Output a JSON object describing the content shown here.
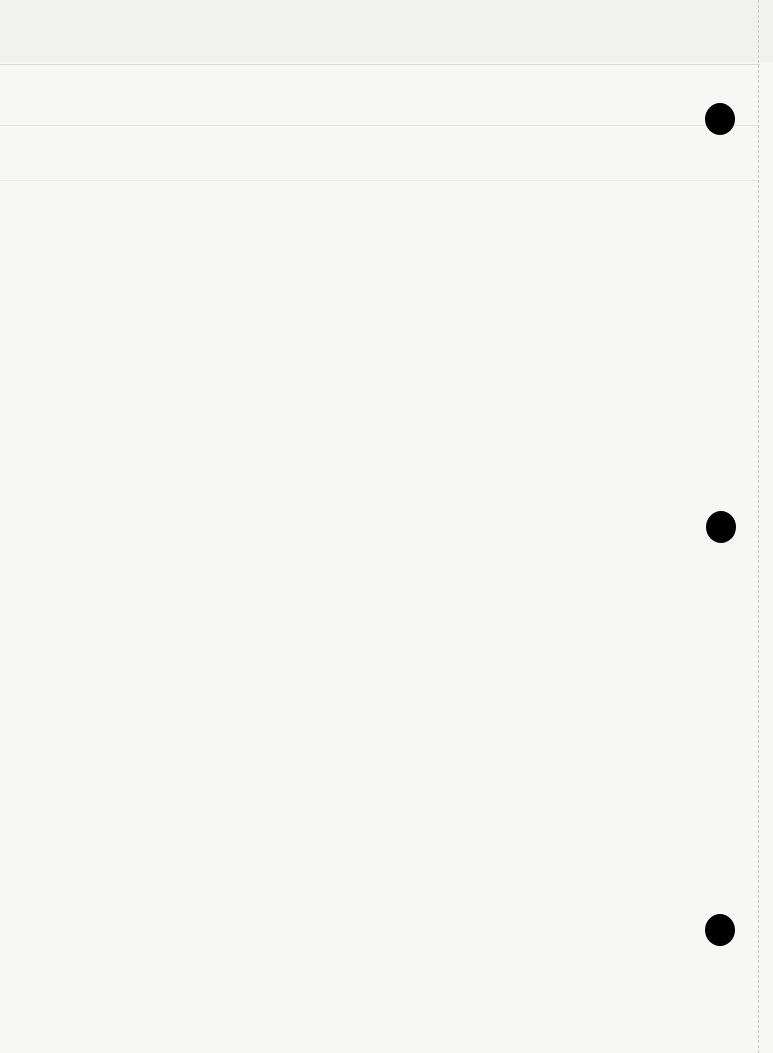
{
  "page": {
    "type": "blank scanned sheet",
    "text": "",
    "features": {
      "punch_holes": 3,
      "ruled_lines": 3,
      "right_edge": "dashed perforation line"
    }
  }
}
